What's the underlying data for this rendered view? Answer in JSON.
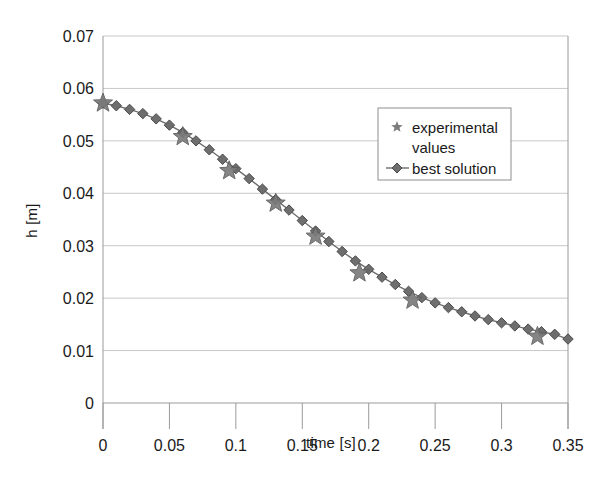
{
  "chart_data": {
    "type": "scatter",
    "title": "",
    "xlabel": "time [s]",
    "ylabel": "h [m]",
    "xlim": [
      0,
      0.35
    ],
    "ylim": [
      0,
      0.07
    ],
    "xticks": [
      "0",
      "0.05",
      "0.1",
      "0.15",
      "0.2",
      "0.25",
      "0.3",
      "0.35"
    ],
    "xtick_values": [
      0,
      0.05,
      0.1,
      0.15,
      0.2,
      0.25,
      0.3,
      0.35
    ],
    "yticks": [
      "0",
      "0.01",
      "0.02",
      "0.03",
      "0.04",
      "0.05",
      "0.06",
      "0.07"
    ],
    "ytick_values": [
      0,
      0.01,
      0.02,
      0.03,
      0.04,
      0.05,
      0.06,
      0.07
    ],
    "grid": "horizontal",
    "legend_position": "upper-right-inside",
    "series": [
      {
        "name": "experimental values",
        "marker": "star",
        "line": "none",
        "color": "#7b7b7b",
        "x": [
          0.0,
          0.06,
          0.095,
          0.13,
          0.16,
          0.193,
          0.233,
          0.327
        ],
        "y": [
          0.0572,
          0.0508,
          0.0443,
          0.0381,
          0.0318,
          0.0248,
          0.0196,
          0.0127
        ]
      },
      {
        "name": "best solution",
        "marker": "diamond",
        "line": "solid",
        "color": "#6e6e6e",
        "x": [
          0.0,
          0.01,
          0.02,
          0.03,
          0.04,
          0.05,
          0.06,
          0.07,
          0.08,
          0.09,
          0.1,
          0.11,
          0.12,
          0.13,
          0.14,
          0.15,
          0.16,
          0.17,
          0.18,
          0.19,
          0.2,
          0.21,
          0.22,
          0.23,
          0.24,
          0.25,
          0.26,
          0.27,
          0.28,
          0.29,
          0.3,
          0.31,
          0.32,
          0.33,
          0.34,
          0.35
        ],
        "y": [
          0.0572,
          0.0567,
          0.056,
          0.0552,
          0.0542,
          0.053,
          0.0516,
          0.05,
          0.0483,
          0.0465,
          0.0447,
          0.0428,
          0.0408,
          0.0388,
          0.0368,
          0.0348,
          0.0328,
          0.0308,
          0.0289,
          0.0271,
          0.0255,
          0.024,
          0.0226,
          0.0213,
          0.0201,
          0.0191,
          0.0182,
          0.0174,
          0.0166,
          0.0159,
          0.0153,
          0.0147,
          0.0141,
          0.0136,
          0.0131,
          0.0122
        ]
      }
    ],
    "legend": [
      {
        "label": "experimental values",
        "marker": "star",
        "color": "#7b7b7b"
      },
      {
        "label": "best solution",
        "marker": "diamond",
        "color": "#6e6e6e"
      }
    ]
  },
  "style": {
    "grid_color": "#c8c8c8",
    "axis_color": "#9a9a9a",
    "text_color": "#1a1a1a",
    "legend_border": "#8d8d8d",
    "legend_bg": "#ffffff",
    "plot_bg": "#ffffff"
  },
  "geometry": {
    "left": 103,
    "right": 568,
    "top": 36,
    "bottom": 403
  }
}
